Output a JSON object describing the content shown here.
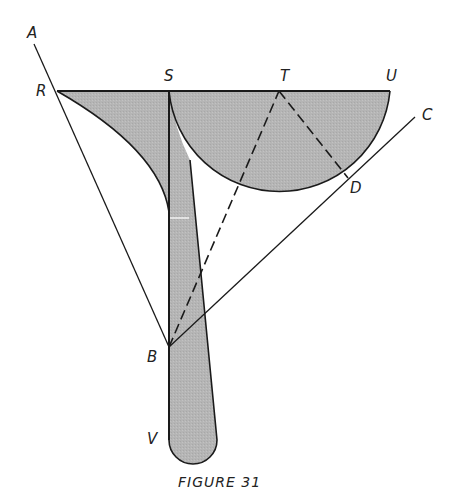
{
  "figure": {
    "caption": "FIGURE 31",
    "fill_color": "#b3b3b3",
    "stroke_color": "#1a1a1a",
    "points": {
      "A": {
        "label": "A",
        "x": 34,
        "y": 44
      },
      "R": {
        "label": "R",
        "x": 57,
        "y": 91
      },
      "S": {
        "label": "S",
        "x": 169,
        "y": 91
      },
      "T": {
        "label": "T",
        "x": 279,
        "y": 91
      },
      "U": {
        "label": "U",
        "x": 390,
        "y": 91
      },
      "C": {
        "label": "C",
        "x": 415,
        "y": 117
      },
      "D": {
        "label": "D",
        "x": 348,
        "y": 178
      },
      "B": {
        "label": "B",
        "x": 169,
        "y": 347
      },
      "V": {
        "label": "V",
        "x": 169,
        "y": 440
      }
    },
    "lines": [
      {
        "from": "A",
        "to": "B",
        "style": "solid"
      },
      {
        "from": "R",
        "to": "U",
        "style": "solid"
      },
      {
        "from": "B",
        "to": "C",
        "style": "solid"
      },
      {
        "from": "B",
        "to": "T",
        "style": "dashed"
      },
      {
        "from": "T",
        "to": "D",
        "style": "dashed"
      }
    ]
  }
}
